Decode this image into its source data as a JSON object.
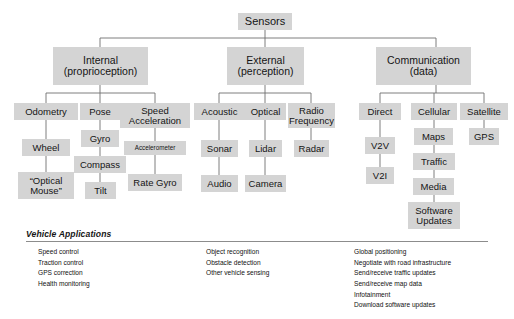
{
  "diagram": {
    "type": "tree",
    "root": {
      "label": "Sensors"
    },
    "level1": [
      {
        "label": "Internal\n(proprioception)"
      },
      {
        "label": "External\n(perception)"
      },
      {
        "label": "Communication\n(data)"
      }
    ],
    "internal": {
      "odometry": "Odometry",
      "odometry_chain": [
        "Wheel",
        "“Optical\nMouse”"
      ],
      "pose": "Pose",
      "pose_chain": [
        "Gyro",
        "Compass",
        "Tilt"
      ],
      "speed": "Speed\nAcceleration",
      "speed_chain": [
        "Accelerometer",
        "Rate Gyro"
      ]
    },
    "external": {
      "acoustic": "Acoustic",
      "acoustic_chain": [
        "Sonar",
        "Audio"
      ],
      "optical": "Optical",
      "optical_chain": [
        "Lidar",
        "Camera"
      ],
      "radio": "Radio\nFrequency",
      "radio_chain": [
        "Radar"
      ]
    },
    "communication": {
      "direct": "Direct",
      "direct_chain": [
        "V2V",
        "V2I"
      ],
      "cellular": "Cellular",
      "cellular_chain": [
        "Maps",
        "Traffic",
        "Media",
        "Software\nUpdates"
      ],
      "satellite": "Satellite",
      "satellite_chain": [
        "GPS"
      ]
    }
  },
  "applications": {
    "title": "Vehicle Applications",
    "columns": [
      [
        "Speed control",
        "Traction control",
        "GPS correction",
        "Health monitoring"
      ],
      [
        "Object recognition",
        "Obstacle detection",
        "Other vehicle sensing"
      ],
      [
        "Global positioning",
        "Negotiate with road infrastructure",
        "Send/receive traffic updates",
        "Send/receive map data",
        "Infotainment",
        "Download software updates"
      ]
    ]
  },
  "colors": {
    "box_fill": "#d4d4d4",
    "connector": "#6f6f6f",
    "text": "#151515"
  }
}
